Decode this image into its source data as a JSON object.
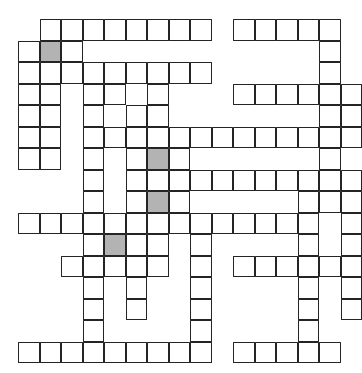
{
  "puzzle": {
    "type": "crossword-grid",
    "title": "",
    "columns": 16,
    "rows": 16,
    "cell_size": 21.5,
    "origin_x": 18,
    "origin_y": 19,
    "colors": {
      "cell_fill": "#ffffff",
      "cell_border": "#242424",
      "shaded_fill": "#b3b3b3",
      "page_background": "#ffffff"
    },
    "shaded_cells": [
      {
        "col": 1,
        "row": 1
      },
      {
        "col": 6,
        "row": 6
      },
      {
        "col": 6,
        "row": 8
      },
      {
        "col": 4,
        "row": 10
      }
    ],
    "filled_letters": [],
    "clue_numbers": [],
    "rows_map": [
      {
        "row": 0,
        "cols": [
          1,
          2,
          3,
          4,
          5,
          6,
          7,
          8,
          10,
          11,
          12,
          13,
          14
        ]
      },
      {
        "row": 1,
        "cols": [
          0,
          1,
          2,
          14
        ]
      },
      {
        "row": 2,
        "cols": [
          0,
          1,
          2,
          3,
          4,
          5,
          6,
          7,
          8,
          14
        ]
      },
      {
        "row": 3,
        "cols": [
          0,
          1,
          3,
          4,
          6,
          10,
          11,
          12,
          13,
          14,
          15
        ]
      },
      {
        "row": 4,
        "cols": [
          0,
          1,
          3,
          5,
          6,
          14,
          15
        ]
      },
      {
        "row": 5,
        "cols": [
          0,
          1,
          3,
          4,
          5,
          6,
          7,
          8,
          9,
          10,
          11,
          12,
          13,
          14,
          15
        ]
      },
      {
        "row": 6,
        "cols": [
          0,
          1,
          3,
          5,
          6,
          7,
          14
        ]
      },
      {
        "row": 7,
        "cols": [
          3,
          5,
          6,
          7,
          8,
          9,
          10,
          11,
          12,
          13,
          14,
          15
        ]
      },
      {
        "row": 8,
        "cols": [
          3,
          5,
          6,
          7,
          13,
          14,
          15
        ]
      },
      {
        "row": 9,
        "cols": [
          0,
          1,
          2,
          3,
          4,
          5,
          6,
          7,
          8,
          9,
          10,
          11,
          12,
          13,
          15
        ]
      },
      {
        "row": 10,
        "cols": [
          3,
          4,
          5,
          6,
          8,
          13,
          15
        ]
      },
      {
        "row": 11,
        "cols": [
          2,
          3,
          4,
          5,
          6,
          8,
          10,
          11,
          12,
          13,
          14,
          15
        ]
      },
      {
        "row": 12,
        "cols": [
          3,
          5,
          8,
          13,
          15
        ]
      },
      {
        "row": 13,
        "cols": [
          3,
          5,
          8,
          13,
          15
        ]
      },
      {
        "row": 14,
        "cols": [
          3,
          8,
          13
        ]
      },
      {
        "row": 15,
        "cols": [
          0,
          1,
          2,
          3,
          4,
          5,
          6,
          7,
          8,
          10,
          11,
          12,
          13,
          14
        ]
      }
    ]
  }
}
